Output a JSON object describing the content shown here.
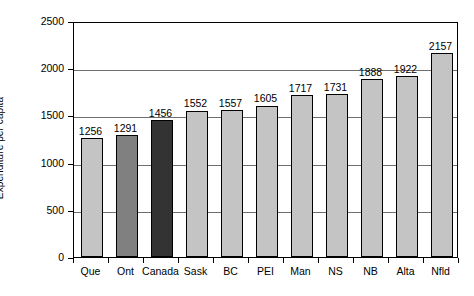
{
  "chart_data": {
    "type": "bar",
    "title": "",
    "subtitle": "",
    "xlabel": "",
    "ylabel": "Expenditure per capita",
    "categories": [
      "Que",
      "Ont",
      "Canada",
      "Sask",
      "BC",
      "PEI",
      "Man",
      "NS",
      "NB",
      "Alta",
      "Nfld"
    ],
    "values": [
      1256,
      1291,
      1456,
      1552,
      1557,
      1605,
      1717,
      1731,
      1888,
      1922,
      2157
    ],
    "data_labels": [
      "1256",
      "1291",
      "1456",
      "1552",
      "1557",
      "1605",
      "1717",
      "1731",
      "1888",
      "1922",
      "2157"
    ],
    "bar_colors": [
      "#c4c4c4",
      "#808080",
      "#333333",
      "#c4c4c4",
      "#c4c4c4",
      "#c4c4c4",
      "#c4c4c4",
      "#c4c4c4",
      "#c4c4c4",
      "#c4c4c4",
      "#c4c4c4"
    ],
    "ylim": [
      0,
      2500
    ],
    "ytick_values": [
      0,
      500,
      1000,
      1500,
      2000,
      2500
    ],
    "ytick_labels": [
      "0",
      "500",
      "1000",
      "1500",
      "2000",
      "2500"
    ],
    "grid": "horizontal",
    "legend": "none",
    "legend_position": "none",
    "frame": "box",
    "annotations": []
  },
  "style": {
    "axis_color": "#000000",
    "grid_color": "#6f6f6f",
    "background": "#ffffff",
    "bar_outline": "#000000",
    "bar_light": "#c4c4c4",
    "bar_medium": "#808080",
    "bar_dark": "#333333"
  }
}
